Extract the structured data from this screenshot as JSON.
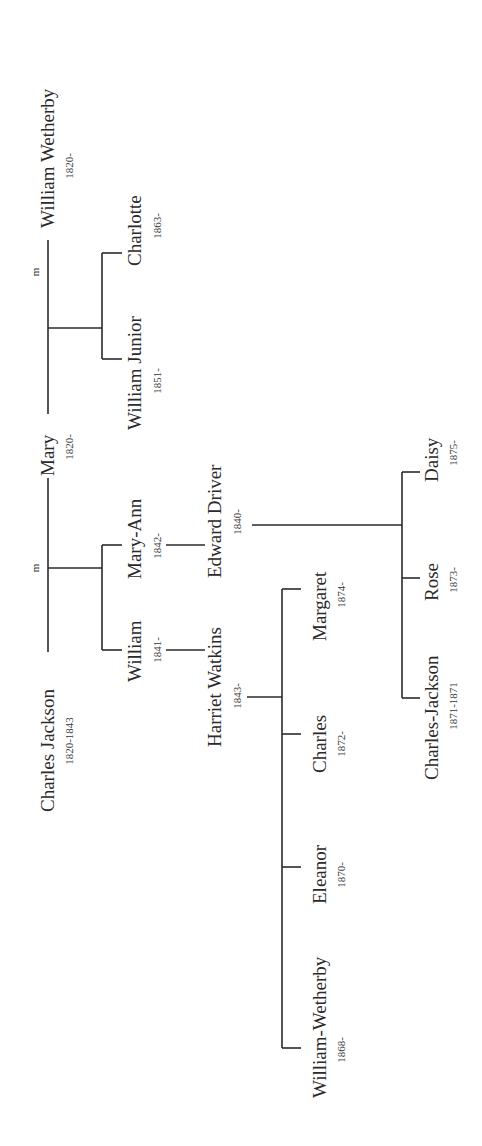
{
  "diagram": {
    "type": "family-tree",
    "orientation": "rotated-90-ccw",
    "line_color": "#2a2a2a",
    "marriage_marker": "m",
    "people": {
      "william_wetherby_sr": {
        "name": "William Wetherby",
        "dates": "1820-"
      },
      "mary": {
        "name": "Mary",
        "dates": "1820-"
      },
      "charles_jackson_sr": {
        "name": "Charles Jackson",
        "dates": "1820-1843"
      },
      "charlotte": {
        "name": "Charlotte",
        "dates": "1863-"
      },
      "william_junior": {
        "name": "William Junior",
        "dates": "1851-"
      },
      "mary_ann": {
        "name": "Mary-Ann",
        "dates": "1842-"
      },
      "william": {
        "name": "William",
        "dates": "1841-"
      },
      "edward_driver": {
        "name": "Edward Driver",
        "dates": "1840-"
      },
      "harriet_watkins": {
        "name": "Harriet Watkins",
        "dates": "1843-"
      },
      "margaret": {
        "name": "Margaret",
        "dates": "1874-"
      },
      "charles": {
        "name": "Charles",
        "dates": "1872-"
      },
      "eleanor": {
        "name": "Eleanor",
        "dates": "1870-"
      },
      "william_wetherby_jr": {
        "name": "William-Wetherby",
        "dates": "1868-"
      },
      "daisy": {
        "name": "Daisy",
        "dates": "1875-"
      },
      "rose": {
        "name": "Rose",
        "dates": "1873-"
      },
      "charles_jackson_jr": {
        "name": "Charles-Jackson",
        "dates": "1871-1871"
      }
    },
    "marriages": [
      {
        "spouses": [
          "Mary",
          "William Wetherby"
        ],
        "marker": "m",
        "children": [
          "William Junior",
          "Charlotte"
        ]
      },
      {
        "spouses": [
          "Charles Jackson",
          "Mary"
        ],
        "marker": "m",
        "children": [
          "William",
          "Mary-Ann"
        ]
      },
      {
        "spouses": [
          "William",
          "Harriet Watkins"
        ],
        "children": [
          "William-Wetherby",
          "Eleanor",
          "Charles",
          "Margaret"
        ]
      },
      {
        "spouses": [
          "Mary-Ann",
          "Edward Driver"
        ],
        "children": [
          "Charles-Jackson",
          "Rose",
          "Daisy"
        ]
      }
    ]
  }
}
